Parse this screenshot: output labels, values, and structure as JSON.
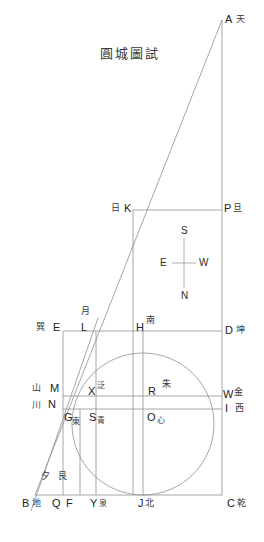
{
  "figure": {
    "title": "圓城圖試",
    "width": 264,
    "height": 542,
    "background": "#ffffff",
    "line_color": "#8a8a8a",
    "text_color": "#2b2b2b"
  },
  "compass": {
    "top": "S",
    "bottom": "N",
    "left": "E",
    "right": "W"
  },
  "points": {
    "A": {
      "latin": "A",
      "han": "天"
    },
    "B": {
      "latin": "B",
      "han": "地"
    },
    "C": {
      "latin": "C",
      "han": "乾"
    },
    "D": {
      "latin": "D",
      "han": "坤"
    },
    "E": {
      "latin": "E",
      "han": "巽"
    },
    "F": {
      "latin": "F",
      "han": "艮"
    },
    "G": {
      "latin": "G",
      "han": "東"
    },
    "H": {
      "latin": "H",
      "han": "南"
    },
    "I": {
      "latin": "I",
      "han": "西"
    },
    "J": {
      "latin": "J",
      "han": "北"
    },
    "K": {
      "latin": "K",
      "han": "日"
    },
    "L": {
      "latin": "L",
      "han": "月"
    },
    "M": {
      "latin": "M",
      "han": "山"
    },
    "N": {
      "latin": "N",
      "han": "川"
    },
    "O": {
      "latin": "O",
      "han": "心"
    },
    "P": {
      "latin": "P",
      "han": "旦"
    },
    "Q": {
      "latin": "Q",
      "han": "夕"
    },
    "R": {
      "latin": "R",
      "han": "朱"
    },
    "S": {
      "latin": "S",
      "han": "青"
    },
    "W": {
      "latin": "W",
      "han": "金"
    },
    "X": {
      "latin": "X",
      "han": "泛"
    },
    "Y": {
      "latin": "Y",
      "han": "泉"
    }
  },
  "geometry": {
    "circle": {
      "cx": 143,
      "cy": 424,
      "r": 71
    },
    "rect_outer": {
      "left": 63,
      "top": 331,
      "right": 222,
      "bottom": 495
    },
    "baseline_y": 495,
    "right_axis_x": 222,
    "top_axis_y": 20,
    "k_row_y": 210,
    "md_row_y": 396,
    "ni_row_y": 409,
    "columns": [
      63,
      80,
      96,
      143,
      222
    ],
    "b_x": 35
  }
}
